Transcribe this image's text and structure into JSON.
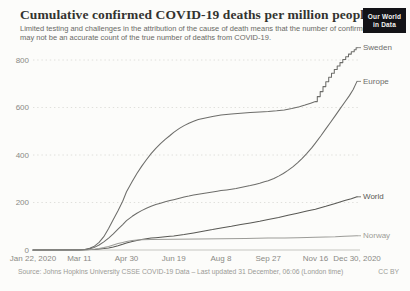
{
  "header": {
    "title": "Cumulative confirmed COVID-19 deaths per million people",
    "subtitle_line1": "Limited testing and challenges in the attribution of the cause of death means that the number of confirmed deaths",
    "subtitle_line2": "may not be an accurate count of the true number of deaths from COVID-19.",
    "logo": {
      "line1": "Our World",
      "line2": "in Data"
    }
  },
  "footer": {
    "source": "Source: Johns Hopkins University CSSE COVID-19 Data – Last updated 31 December, 06:06 (London time)",
    "license": "CC BY"
  },
  "colors": {
    "background": "#fcfcfa",
    "gridline": "#dcdcd8",
    "baseline": "#c6c6c1",
    "tick_text": "#8a8a85",
    "logo_bg": "#131317"
  },
  "chart_data": {
    "type": "line",
    "title": "Cumulative confirmed COVID-19 deaths per million people",
    "xlabel": "",
    "ylabel": "deaths per million",
    "grid": "horizontal-dotted",
    "legend_position": "end-of-line labels, right side",
    "x": {
      "unit": "date",
      "start": "Jan 22, 2020",
      "end": "Dec 30, 2020",
      "tick_labels": [
        "Jan 22, 2020",
        "Mar 11",
        "Apr 30",
        "Jun 19",
        "Aug 8",
        "Sep 27",
        "Nov 16",
        "Dec 30, 2020"
      ],
      "tick_days": [
        0,
        49,
        99,
        149,
        199,
        249,
        299,
        343
      ],
      "range_days": [
        0,
        343
      ]
    },
    "y": {
      "ticks": [
        0,
        200,
        400,
        600,
        800
      ],
      "range": [
        0,
        860
      ]
    },
    "series": [
      {
        "name": "Sweden",
        "color": "#6d6d6a",
        "end_value": 852,
        "points": [
          [
            0,
            0
          ],
          [
            40,
            0
          ],
          [
            49,
            0.5
          ],
          [
            55,
            2
          ],
          [
            60,
            7
          ],
          [
            65,
            16
          ],
          [
            70,
            32
          ],
          [
            75,
            56
          ],
          [
            80,
            90
          ],
          [
            85,
            128
          ],
          [
            90,
            165
          ],
          [
            95,
            205
          ],
          [
            99,
            245
          ],
          [
            105,
            288
          ],
          [
            110,
            322
          ],
          [
            115,
            352
          ],
          [
            120,
            380
          ],
          [
            125,
            406
          ],
          [
            130,
            428
          ],
          [
            135,
            448
          ],
          [
            140,
            466
          ],
          [
            145,
            482
          ],
          [
            149,
            495
          ],
          [
            155,
            512
          ],
          [
            160,
            524
          ],
          [
            165,
            534
          ],
          [
            170,
            542
          ],
          [
            175,
            549
          ],
          [
            180,
            554
          ],
          [
            190,
            562
          ],
          [
            199,
            568
          ],
          [
            210,
            573
          ],
          [
            220,
            576
          ],
          [
            230,
            579
          ],
          [
            240,
            581
          ],
          [
            249,
            583
          ],
          [
            258,
            586
          ],
          [
            266,
            590
          ],
          [
            274,
            596
          ],
          [
            282,
            603
          ],
          [
            288,
            610
          ],
          [
            294,
            618
          ],
          [
            299,
            625
          ],
          [
            301,
            625
          ],
          [
            301,
            646
          ],
          [
            304,
            646
          ],
          [
            304,
            667
          ],
          [
            307,
            667
          ],
          [
            307,
            688
          ],
          [
            310,
            688
          ],
          [
            310,
            708
          ],
          [
            313,
            708
          ],
          [
            313,
            727
          ],
          [
            316,
            727
          ],
          [
            316,
            744
          ],
          [
            319,
            744
          ],
          [
            319,
            760
          ],
          [
            322,
            760
          ],
          [
            322,
            775
          ],
          [
            325,
            775
          ],
          [
            325,
            789
          ],
          [
            328,
            789
          ],
          [
            328,
            802
          ],
          [
            331,
            802
          ],
          [
            331,
            814
          ],
          [
            334,
            814
          ],
          [
            334,
            825
          ],
          [
            337,
            825
          ],
          [
            337,
            835
          ],
          [
            340,
            835
          ],
          [
            340,
            843
          ],
          [
            342,
            843
          ],
          [
            342,
            852
          ],
          [
            343,
            852
          ]
        ]
      },
      {
        "name": "Europe",
        "color": "#6d6d6a",
        "end_value": 710,
        "points": [
          [
            0,
            0
          ],
          [
            45,
            0.3
          ],
          [
            49,
            0.6
          ],
          [
            55,
            2
          ],
          [
            60,
            5
          ],
          [
            65,
            11
          ],
          [
            70,
            21
          ],
          [
            75,
            34
          ],
          [
            80,
            50
          ],
          [
            85,
            68
          ],
          [
            90,
            88
          ],
          [
            95,
            107
          ],
          [
            99,
            124
          ],
          [
            105,
            142
          ],
          [
            110,
            155
          ],
          [
            115,
            166
          ],
          [
            120,
            176
          ],
          [
            125,
            184
          ],
          [
            130,
            191
          ],
          [
            135,
            197
          ],
          [
            140,
            203
          ],
          [
            145,
            208
          ],
          [
            149,
            212
          ],
          [
            155,
            218
          ],
          [
            160,
            223
          ],
          [
            165,
            227
          ],
          [
            170,
            231
          ],
          [
            175,
            235
          ],
          [
            180,
            238
          ],
          [
            185,
            241
          ],
          [
            190,
            244
          ],
          [
            195,
            247
          ],
          [
            199,
            250
          ],
          [
            205,
            253
          ],
          [
            210,
            256
          ],
          [
            215,
            259
          ],
          [
            220,
            263
          ],
          [
            225,
            267
          ],
          [
            230,
            271
          ],
          [
            235,
            276
          ],
          [
            240,
            281
          ],
          [
            245,
            287
          ],
          [
            249,
            292
          ],
          [
            255,
            301
          ],
          [
            260,
            311
          ],
          [
            265,
            322
          ],
          [
            270,
            335
          ],
          [
            275,
            350
          ],
          [
            280,
            367
          ],
          [
            285,
            386
          ],
          [
            290,
            407
          ],
          [
            295,
            430
          ],
          [
            299,
            450
          ],
          [
            305,
            482
          ],
          [
            310,
            510
          ],
          [
            315,
            538
          ],
          [
            320,
            566
          ],
          [
            325,
            594
          ],
          [
            330,
            622
          ],
          [
            335,
            650
          ],
          [
            339,
            676
          ],
          [
            343,
            710
          ]
        ]
      },
      {
        "name": "World",
        "color": "#58585four",
        "end_value": 224,
        "points": [
          [
            0,
            0
          ],
          [
            49,
            0.7
          ],
          [
            55,
            1
          ],
          [
            60,
            1.6
          ],
          [
            65,
            2.5
          ],
          [
            70,
            3.8
          ],
          [
            75,
            5.8
          ],
          [
            80,
            8.7
          ],
          [
            85,
            13
          ],
          [
            90,
            18
          ],
          [
            95,
            24
          ],
          [
            99,
            30
          ],
          [
            105,
            36
          ],
          [
            110,
            40
          ],
          [
            115,
            44
          ],
          [
            120,
            47
          ],
          [
            125,
            50
          ],
          [
            130,
            52
          ],
          [
            135,
            54
          ],
          [
            140,
            56
          ],
          [
            145,
            58
          ],
          [
            149,
            59
          ],
          [
            160,
            65
          ],
          [
            170,
            72
          ],
          [
            180,
            79
          ],
          [
            190,
            86
          ],
          [
            199,
            93
          ],
          [
            210,
            100
          ],
          [
            220,
            107
          ],
          [
            230,
            114
          ],
          [
            240,
            121
          ],
          [
            249,
            128
          ],
          [
            260,
            137
          ],
          [
            270,
            146
          ],
          [
            280,
            155
          ],
          [
            290,
            164
          ],
          [
            299,
            172
          ],
          [
            310,
            184
          ],
          [
            320,
            196
          ],
          [
            330,
            208
          ],
          [
            337,
            216
          ],
          [
            343,
            224
          ]
        ]
      },
      {
        "name": "Norway",
        "color": "#9c9c98",
        "end_value": 60,
        "points": [
          [
            0,
            0
          ],
          [
            49,
            0
          ],
          [
            58,
            1
          ],
          [
            65,
            3
          ],
          [
            70,
            6
          ],
          [
            75,
            10
          ],
          [
            80,
            15
          ],
          [
            85,
            21
          ],
          [
            90,
            27
          ],
          [
            95,
            32
          ],
          [
            99,
            36
          ],
          [
            105,
            40
          ],
          [
            110,
            42
          ],
          [
            115,
            43
          ],
          [
            125,
            44
          ],
          [
            149,
            45
          ],
          [
            175,
            46
          ],
          [
            199,
            47
          ],
          [
            225,
            48
          ],
          [
            249,
            50
          ],
          [
            266,
            51
          ],
          [
            280,
            52
          ],
          [
            290,
            53
          ],
          [
            299,
            54
          ],
          [
            310,
            55
          ],
          [
            320,
            56
          ],
          [
            330,
            58
          ],
          [
            337,
            59
          ],
          [
            343,
            60
          ]
        ]
      }
    ]
  }
}
